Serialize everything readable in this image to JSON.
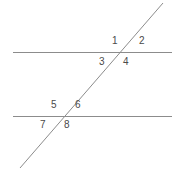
{
  "figure": {
    "name": "parallel-lines-transversal-angles",
    "width": 181,
    "height": 171,
    "background_color": "#ffffff",
    "line_color": "#8c8c8c",
    "label_color": "#4a4a4a",
    "line_width": 1
  },
  "lines": [
    {
      "id": "top-parallel-line",
      "role": "parallel-line",
      "x1": 13,
      "y1": 52,
      "x2": 172,
      "y2": 52
    },
    {
      "id": "bottom-parallel-line",
      "role": "parallel-line",
      "x1": 13,
      "y1": 116,
      "x2": 172,
      "y2": 116
    },
    {
      "id": "transversal-line",
      "role": "transversal",
      "x1": 20,
      "y1": 168,
      "x2": 163,
      "y2": 3
    }
  ],
  "intersections": [
    {
      "id": "upper-intersection",
      "x": 122,
      "y": 52
    },
    {
      "id": "lower-intersection",
      "x": 63,
      "y": 116
    }
  ],
  "angle_labels": [
    {
      "id": "angle-1",
      "text": "1",
      "x": 112,
      "y": 36,
      "intersection": "upper-intersection",
      "position": "upper-left"
    },
    {
      "id": "angle-2",
      "text": "2",
      "x": 139,
      "y": 36,
      "intersection": "upper-intersection",
      "position": "upper-right"
    },
    {
      "id": "angle-3",
      "text": "3",
      "x": 99,
      "y": 57,
      "intersection": "upper-intersection",
      "position": "lower-left"
    },
    {
      "id": "angle-4",
      "text": "4",
      "x": 123,
      "y": 57,
      "intersection": "upper-intersection",
      "position": "lower-right"
    },
    {
      "id": "angle-5",
      "text": "5",
      "x": 51,
      "y": 100,
      "intersection": "lower-intersection",
      "position": "upper-left"
    },
    {
      "id": "angle-6",
      "text": "6",
      "x": 75,
      "y": 100,
      "intersection": "lower-intersection",
      "position": "upper-right"
    },
    {
      "id": "angle-7",
      "text": "7",
      "x": 40,
      "y": 120,
      "intersection": "lower-intersection",
      "position": "lower-left"
    },
    {
      "id": "angle-8",
      "text": "8",
      "x": 64,
      "y": 120,
      "intersection": "lower-intersection",
      "position": "lower-right"
    }
  ]
}
